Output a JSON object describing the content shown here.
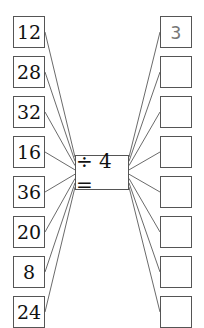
{
  "operation": {
    "label": "÷ 4 =",
    "divisor": 4
  },
  "inputs": [
    "12",
    "28",
    "32",
    "16",
    "36",
    "20",
    "8",
    "24"
  ],
  "answers": [
    "3",
    "",
    "",
    "",
    "",
    "",
    "",
    ""
  ],
  "layout": {
    "row_top": 16,
    "row_pitch": 40
  }
}
